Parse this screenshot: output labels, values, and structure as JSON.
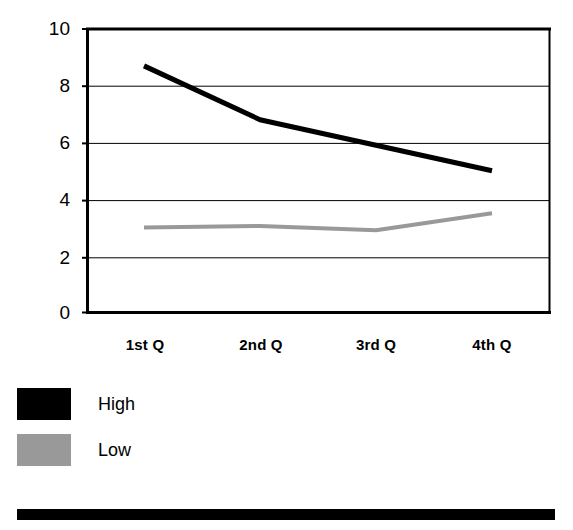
{
  "chart_data": {
    "type": "line",
    "title": "",
    "subtitle": "",
    "xlabel": "",
    "ylabel": "",
    "categories": [
      "1st Q",
      "2nd Q",
      "3rd Q",
      "4th Q"
    ],
    "series": [
      {
        "name": "High",
        "values": [
          8.7,
          6.8,
          5.9,
          5.0
        ],
        "color": "#000000",
        "line_width": 5
      },
      {
        "name": "Low",
        "values": [
          3.0,
          3.05,
          2.9,
          3.5
        ],
        "color": "#999999",
        "line_width": 4
      }
    ],
    "ylim": [
      0,
      10
    ],
    "yticks": [
      0,
      2,
      4,
      6,
      8,
      10
    ],
    "ytick_labels": [
      "0",
      "2",
      "4",
      "6",
      "8",
      "10"
    ],
    "grid": true,
    "grid_axis": "y",
    "legend_position": "below-left",
    "annotations": []
  },
  "axes": {
    "y_labels": [
      "10",
      "8",
      "6",
      "4",
      "2",
      "0"
    ],
    "x_labels": [
      "1st Q",
      "2nd Q",
      "3rd Q",
      "4th Q"
    ]
  },
  "legend": {
    "entries": [
      {
        "label": "High",
        "color": "#000000"
      },
      {
        "label": "Low",
        "color": "#999999"
      }
    ]
  },
  "decoration": {
    "bottom_bar_color": "#000000"
  },
  "colors": {
    "high": "#000000",
    "low": "#999999",
    "axis": "#000000",
    "grid": "#000000",
    "background": "#ffffff"
  }
}
